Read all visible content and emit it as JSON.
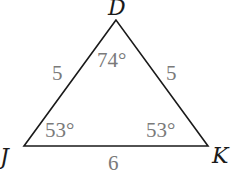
{
  "diagram": {
    "type": "triangle",
    "colors": {
      "edge": "#1a1a1a",
      "vertex_label": "#1a1a1a",
      "measure_label": "#7a7a7a"
    },
    "vertices": [
      {
        "name": "D",
        "x": 116,
        "y": 20
      },
      {
        "name": "J",
        "x": 24,
        "y": 146
      },
      {
        "name": "K",
        "x": 208,
        "y": 146
      }
    ],
    "sides": [
      {
        "between": "D-J",
        "length": "5"
      },
      {
        "between": "D-K",
        "length": "5"
      },
      {
        "between": "J-K",
        "length": "6"
      }
    ],
    "angles": [
      {
        "at": "D",
        "value": "74°"
      },
      {
        "at": "J",
        "value": "53°"
      },
      {
        "at": "K",
        "value": "53°"
      }
    ]
  }
}
